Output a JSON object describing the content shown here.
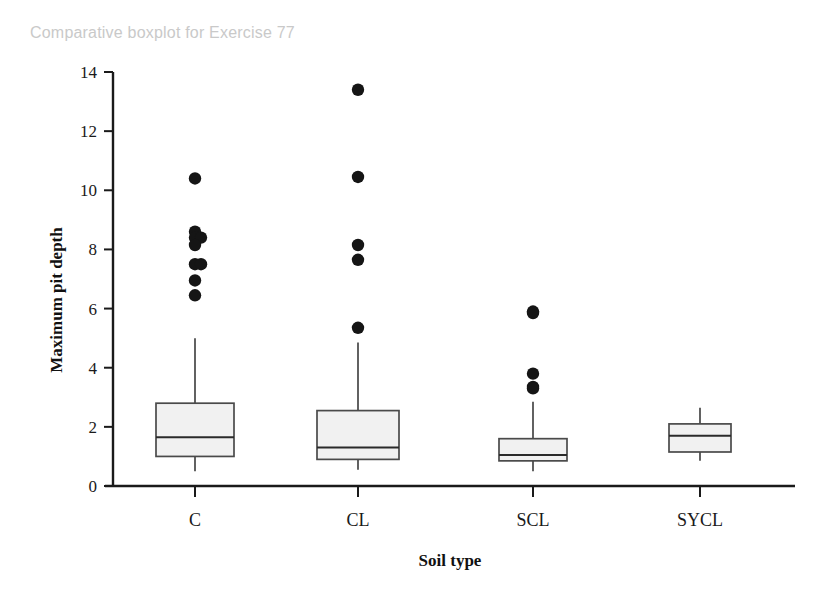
{
  "title": "Comparative boxplot for Exercise 77",
  "chart_data": {
    "type": "box",
    "title": "Comparative boxplot for Exercise 77",
    "xlabel": "Soil type",
    "ylabel": "Maximum pit depth",
    "categories": [
      "C",
      "CL",
      "SCL",
      "SYCL"
    ],
    "ylim": [
      0,
      14
    ],
    "yticks": [
      0,
      2,
      4,
      6,
      8,
      10,
      12,
      14
    ],
    "grid": false,
    "legend": null,
    "boxes": [
      {
        "category": "C",
        "whisker_low": 0.5,
        "q1": 1.0,
        "median": 1.65,
        "q3": 2.8,
        "whisker_high": 5.0,
        "outliers": [
          10.4,
          8.6,
          8.4,
          8.4,
          8.15,
          7.5,
          7.5,
          6.95,
          6.45
        ]
      },
      {
        "category": "CL",
        "whisker_low": 0.55,
        "q1": 0.9,
        "median": 1.3,
        "q3": 2.55,
        "whisker_high": 4.85,
        "outliers": [
          13.4,
          10.45,
          8.15,
          7.65,
          5.35
        ]
      },
      {
        "category": "SCL",
        "whisker_low": 0.5,
        "q1": 0.85,
        "median": 1.05,
        "q3": 1.6,
        "whisker_high": 2.85,
        "outliers": [
          5.9,
          5.85,
          3.8,
          3.35,
          3.3
        ]
      },
      {
        "category": "SYCL",
        "whisker_low": 0.85,
        "q1": 1.15,
        "median": 1.7,
        "q3": 2.1,
        "whisker_high": 2.65,
        "outliers": []
      }
    ]
  },
  "colors": {
    "box_fill": "#f1f1f1",
    "box_stroke": "#4a4a4a",
    "outlier": "#151515",
    "axis": "#1a1a1a",
    "title": "#c9c9c9"
  }
}
